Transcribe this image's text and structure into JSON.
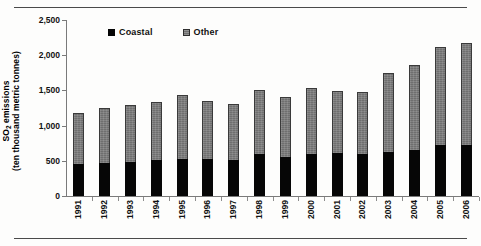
{
  "figure": {
    "has_top_rule": true,
    "has_bottom_rule": true,
    "background": "#ffffff"
  },
  "legend": {
    "position": "top-center",
    "items": [
      {
        "label": "Coastal",
        "color": "#050505",
        "swatch": "solid-black-square"
      },
      {
        "label": "Other",
        "color": "#6f6f6f",
        "swatch": "gray-hatched-square"
      }
    ]
  },
  "axes": {
    "ylabel_line1": "SO",
    "ylabel_sub": "2",
    "ylabel_line1_rest": " emissions",
    "ylabel_line2": "(ten thousand metric tonnes)",
    "yticks": [
      "0",
      "500",
      "1,000",
      "1,500",
      "2,000",
      "2,500"
    ],
    "ytick_values": [
      0,
      500,
      1000,
      1500,
      2000,
      2500
    ],
    "ymin": 0,
    "ymax": 2500,
    "grid": false
  },
  "chart_data": {
    "type": "bar",
    "title": "",
    "subtitle": "",
    "xlabel": "",
    "ylabel": "SO2 emissions (ten thousand metric tonnes)",
    "ylim": [
      0,
      2500
    ],
    "yticks": [
      0,
      500,
      1000,
      1500,
      2000,
      2500
    ],
    "grid": false,
    "legend_position": "top-center",
    "stacked": true,
    "categories": [
      "1991",
      "1992",
      "1993",
      "1994",
      "1995",
      "1996",
      "1997",
      "1998",
      "1999",
      "2000",
      "2001",
      "2002",
      "2003",
      "2004",
      "2005",
      "2006"
    ],
    "series": [
      {
        "name": "Coastal",
        "color": "#050505",
        "values": [
          460,
          470,
          490,
          510,
          530,
          520,
          510,
          590,
          560,
          600,
          610,
          600,
          630,
          660,
          720,
          730
        ]
      },
      {
        "name": "Other",
        "color": "#6f6f6f",
        "values": [
          720,
          780,
          810,
          830,
          900,
          830,
          800,
          910,
          840,
          930,
          880,
          880,
          1120,
          1200,
          1400,
          1450
        ]
      }
    ],
    "totals": [
      1180,
      1250,
      1300,
      1340,
      1430,
      1350,
      1310,
      1500,
      1400,
      1530,
      1490,
      1480,
      1750,
      1860,
      2120,
      2180
    ]
  }
}
